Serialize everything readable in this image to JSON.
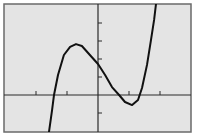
{
  "chart_data": {
    "type": "line",
    "title": "",
    "xlabel": "",
    "ylabel": "",
    "xlim": [
      -3,
      3
    ],
    "ylim": [
      -2,
      5
    ],
    "x_tick_step": 1,
    "y_tick_step": 1,
    "grid": false,
    "legend": null,
    "series": [
      {
        "name": "cubic",
        "x": [
          -1.58,
          -1.48,
          -1.42,
          -1.29,
          -1.1,
          -0.9,
          -0.71,
          -0.52,
          -0.26,
          0.0,
          0.23,
          0.45,
          0.68,
          0.87,
          1.1,
          1.29,
          1.42,
          1.58,
          1.71,
          1.81,
          1.87
        ],
        "y": [
          -2.05,
          -0.83,
          0.0,
          1.11,
          2.22,
          2.67,
          2.83,
          2.72,
          2.22,
          1.72,
          1.11,
          0.44,
          0.0,
          -0.39,
          -0.56,
          -0.28,
          0.39,
          1.67,
          3.06,
          4.17,
          5.06
        ]
      }
    ],
    "features": {
      "local_max": [
        -0.71,
        2.83
      ],
      "local_min": [
        1.1,
        -0.56
      ],
      "y_intercept": 1.72,
      "x_intercepts": [
        -1.42,
        0.68,
        1.32
      ]
    }
  },
  "style": {
    "background": "#ffffff",
    "plot_bg": "#e4e4e4",
    "frame_color": "#6a6a6a",
    "axis_color": "#2a2a2a",
    "curve_color": "#111111"
  },
  "layout": {
    "frame": {
      "x": 4,
      "y": 4,
      "w": 187,
      "h": 128
    },
    "origin_px": [
      98,
      95
    ],
    "x_unit_px": 31,
    "y_unit_px": 18
  }
}
